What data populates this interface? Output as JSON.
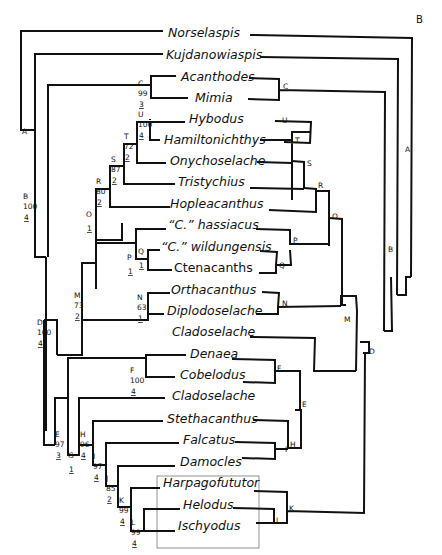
{
  "panel_label": "B",
  "taxa": [
    {
      "id": "norselaspis",
      "name": "Norselaspis",
      "italic": true
    },
    {
      "id": "kujdanowiaspis",
      "name": "Kujdanowiaspis",
      "italic": true
    },
    {
      "id": "acanthodes",
      "name": "Acanthodes",
      "italic": true
    },
    {
      "id": "mimia",
      "name": "Mimia",
      "italic": true
    },
    {
      "id": "hybodus",
      "name": "Hybodus",
      "italic": true
    },
    {
      "id": "hamiltonichthys",
      "name": "Hamiltonichthys",
      "italic": true
    },
    {
      "id": "onychoselache",
      "name": "Onychoselache",
      "italic": true
    },
    {
      "id": "tristychius",
      "name": "Tristychius",
      "italic": true
    },
    {
      "id": "hopleacanthus",
      "name": "Hopleacanthus",
      "italic": true
    },
    {
      "id": "c-hassiacus",
      "name": "“C.”  hassiacus",
      "italic": true
    },
    {
      "id": "c-wildungensis",
      "name": "“C.”  wildungensis",
      "italic": true
    },
    {
      "id": "ctenacanths",
      "name": "Ctenacanths",
      "italic": false
    },
    {
      "id": "orthacanthus",
      "name": "Orthacanthus",
      "italic": true
    },
    {
      "id": "diplodoselache",
      "name": "Diplodoselache",
      "italic": true
    },
    {
      "id": "cladoselache-1",
      "name": "Cladoselache",
      "italic": true
    },
    {
      "id": "denaea",
      "name": "Denaea",
      "italic": true
    },
    {
      "id": "cobelodus",
      "name": "Cobelodus",
      "italic": true
    },
    {
      "id": "cladoselache-2",
      "name": "Cladoselache",
      "italic": true
    },
    {
      "id": "stethacanthus",
      "name": "Stethacanthus",
      "italic": true
    },
    {
      "id": "falcatus",
      "name": "Falcatus",
      "italic": true
    },
    {
      "id": "damocles",
      "name": "Damocles",
      "italic": true
    },
    {
      "id": "harpagofututor",
      "name": "Harpagofututor",
      "italic": true
    },
    {
      "id": "helodus",
      "name": "Helodus",
      "italic": true
    },
    {
      "id": "ischyodus",
      "name": "Ischyodus",
      "italic": true
    }
  ],
  "nodes": [
    {
      "letter": "A",
      "support": "",
      "decay": ""
    },
    {
      "letter": "B",
      "support": "100",
      "decay": "4"
    },
    {
      "letter": "C",
      "support": "99",
      "decay": "3"
    },
    {
      "letter": "D",
      "support": "100",
      "decay": "4"
    },
    {
      "letter": "E",
      "support": "97",
      "decay": "3"
    },
    {
      "letter": "F",
      "support": "100",
      "decay": "4"
    },
    {
      "letter": "G",
      "support": "",
      "decay": "1"
    },
    {
      "letter": "H",
      "support": "96",
      "decay": "4"
    },
    {
      "letter": "I",
      "support": "97",
      "decay": "4"
    },
    {
      "letter": "J",
      "support": "85",
      "decay": "2"
    },
    {
      "letter": "K",
      "support": "99",
      "decay": "4"
    },
    {
      "letter": "L",
      "support": "99",
      "decay": "4"
    },
    {
      "letter": "M",
      "support": "73",
      "decay": "2"
    },
    {
      "letter": "N",
      "support": "63",
      "decay": "1"
    },
    {
      "letter": "O",
      "support": "",
      "decay": "1"
    },
    {
      "letter": "P",
      "support": "",
      "decay": "1"
    },
    {
      "letter": "Q",
      "support": "",
      "decay": "1"
    },
    {
      "letter": "R",
      "support": "80",
      "decay": "2"
    },
    {
      "letter": "S",
      "support": "87",
      "decay": "2"
    },
    {
      "letter": "T",
      "support": "72",
      "decay": "2"
    },
    {
      "letter": "U",
      "support": "100",
      "decay": "4"
    }
  ]
}
